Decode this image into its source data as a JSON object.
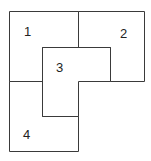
{
  "diagram": {
    "type": "dissection-puzzle",
    "pieces": [
      {
        "id": "piece-1",
        "label": "1"
      },
      {
        "id": "piece-2",
        "label": "2"
      },
      {
        "id": "piece-3",
        "label": "3"
      },
      {
        "id": "piece-4",
        "label": "4"
      }
    ],
    "colors": {
      "stroke": "#3a3a3a",
      "fill": "#ffffff",
      "text": "#222222"
    }
  }
}
